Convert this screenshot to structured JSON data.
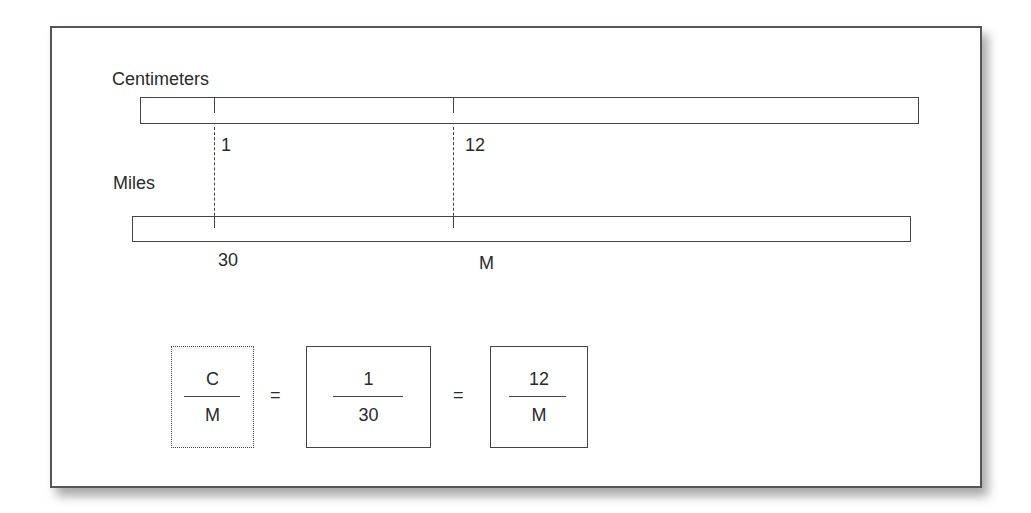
{
  "diagram": {
    "top_scale": {
      "label": "Centimeters",
      "ticks": [
        {
          "value": "1"
        },
        {
          "value": "12"
        }
      ]
    },
    "bottom_scale": {
      "label": "Miles",
      "ticks": [
        {
          "value": "30"
        },
        {
          "value": "M"
        }
      ]
    },
    "equation": {
      "terms": [
        {
          "numerator": "C",
          "denominator": "M",
          "style": "dotted"
        },
        {
          "numerator": "1",
          "denominator": "30",
          "style": "solid"
        },
        {
          "numerator": "12",
          "denominator": "M",
          "style": "solid"
        }
      ],
      "operators": [
        "=",
        "="
      ]
    },
    "colors": {
      "line": "#444444",
      "text": "#2a2a2a",
      "background": "#ffffff"
    }
  }
}
